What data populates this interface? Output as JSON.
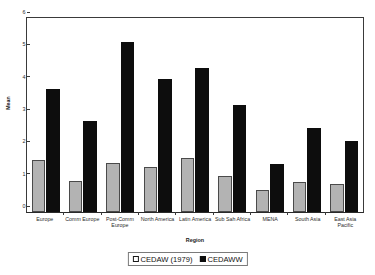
{
  "chart_data": {
    "type": "bar",
    "title": "",
    "xlabel": "Region",
    "ylabel": "Mean",
    "ylim": [
      0,
      6
    ],
    "yticks": [
      0,
      1,
      2,
      3,
      4,
      5,
      6
    ],
    "grid": false,
    "legend_position": "bottom",
    "categories": [
      "Europe",
      "Comm Europe",
      "Post-Comm Europe",
      "North America",
      "Latin America",
      "Sub Sah Africa",
      "MENA",
      "South Asia",
      "East Asia Pacific"
    ],
    "series": [
      {
        "name": "CEDAW (1979)",
        "color": "#b3b3b3",
        "values": [
          1.62,
          0.95,
          1.51,
          1.39,
          1.68,
          1.11,
          0.67,
          0.93,
          0.88
        ]
      },
      {
        "name": "CEDAWW",
        "color": "#0d0d0d",
        "values": [
          3.81,
          2.83,
          5.25,
          4.11,
          4.45,
          3.31,
          1.47,
          2.6,
          2.21
        ]
      }
    ]
  },
  "legend": {
    "items": [
      {
        "label": "CEDAW (1979)",
        "swatch": "light-square-icon"
      },
      {
        "label": "CEDAWW",
        "swatch": "dark-square-icon"
      }
    ]
  }
}
